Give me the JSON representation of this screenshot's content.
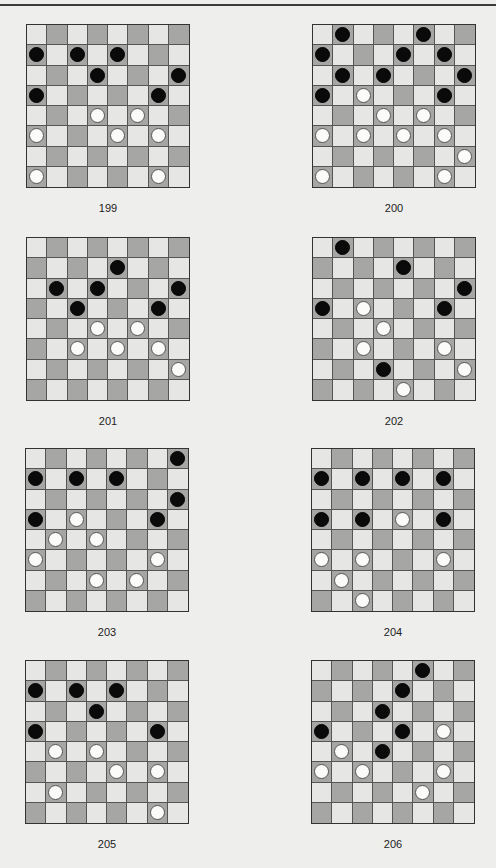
{
  "page": {
    "colors": {
      "light_square": "#e6e6e4",
      "dark_square": "#a6a6a4",
      "black_piece": "#0a0a0a",
      "white_piece": "#fbfbfa"
    }
  },
  "puzzles": [
    {
      "number": "199",
      "left": 26,
      "top": 24,
      "black": [
        [
          1,
          0
        ],
        [
          1,
          2
        ],
        [
          1,
          4
        ],
        [
          2,
          3
        ],
        [
          2,
          7
        ],
        [
          3,
          0
        ],
        [
          3,
          6
        ]
      ],
      "white": [
        [
          4,
          3
        ],
        [
          4,
          5
        ],
        [
          5,
          0
        ],
        [
          5,
          4
        ],
        [
          5,
          6
        ],
        [
          7,
          0
        ],
        [
          7,
          6
        ]
      ]
    },
    {
      "number": "200",
      "left": 312,
      "top": 24,
      "black": [
        [
          0,
          1
        ],
        [
          0,
          5
        ],
        [
          1,
          0
        ],
        [
          1,
          4
        ],
        [
          1,
          6
        ],
        [
          2,
          1
        ],
        [
          2,
          3
        ],
        [
          2,
          7
        ],
        [
          3,
          0
        ],
        [
          3,
          6
        ]
      ],
      "white": [
        [
          3,
          2
        ],
        [
          4,
          3
        ],
        [
          4,
          5
        ],
        [
          5,
          0
        ],
        [
          5,
          2
        ],
        [
          5,
          4
        ],
        [
          5,
          6
        ],
        [
          6,
          7
        ],
        [
          7,
          0
        ],
        [
          7,
          6
        ]
      ]
    },
    {
      "number": "201",
      "left": 26,
      "top": 237,
      "black": [
        [
          1,
          4
        ],
        [
          2,
          1
        ],
        [
          2,
          3
        ],
        [
          2,
          7
        ],
        [
          3,
          2
        ],
        [
          3,
          6
        ]
      ],
      "white": [
        [
          4,
          3
        ],
        [
          4,
          5
        ],
        [
          5,
          2
        ],
        [
          5,
          4
        ],
        [
          5,
          6
        ],
        [
          6,
          7
        ]
      ]
    },
    {
      "number": "202",
      "left": 312,
      "top": 237,
      "black": [
        [
          0,
          1
        ],
        [
          1,
          4
        ],
        [
          2,
          7
        ],
        [
          3,
          0
        ],
        [
          3,
          6
        ],
        [
          6,
          3
        ]
      ],
      "white": [
        [
          3,
          2
        ],
        [
          4,
          3
        ],
        [
          5,
          2
        ],
        [
          5,
          6
        ],
        [
          6,
          7
        ],
        [
          7,
          4
        ]
      ]
    },
    {
      "number": "203",
      "left": 25,
      "top": 448,
      "black": [
        [
          0,
          7
        ],
        [
          1,
          0
        ],
        [
          1,
          2
        ],
        [
          1,
          4
        ],
        [
          2,
          7
        ],
        [
          3,
          0
        ],
        [
          3,
          6
        ]
      ],
      "white": [
        [
          3,
          2
        ],
        [
          4,
          1
        ],
        [
          4,
          3
        ],
        [
          5,
          0
        ],
        [
          5,
          6
        ],
        [
          6,
          3
        ],
        [
          6,
          5
        ]
      ]
    },
    {
      "number": "204",
      "left": 311,
      "top": 448,
      "black": [
        [
          1,
          0
        ],
        [
          1,
          2
        ],
        [
          1,
          4
        ],
        [
          1,
          6
        ],
        [
          3,
          0
        ],
        [
          3,
          2
        ],
        [
          3,
          6
        ]
      ],
      "white": [
        [
          3,
          4
        ],
        [
          5,
          0
        ],
        [
          5,
          2
        ],
        [
          5,
          6
        ],
        [
          6,
          1
        ],
        [
          7,
          2
        ]
      ]
    },
    {
      "number": "205",
      "left": 25,
      "top": 660,
      "black": [
        [
          1,
          0
        ],
        [
          1,
          2
        ],
        [
          1,
          4
        ],
        [
          2,
          3
        ],
        [
          3,
          0
        ],
        [
          3,
          6
        ]
      ],
      "white": [
        [
          4,
          1
        ],
        [
          4,
          3
        ],
        [
          5,
          4
        ],
        [
          5,
          6
        ],
        [
          6,
          1
        ],
        [
          7,
          6
        ]
      ]
    },
    {
      "number": "206",
      "left": 311,
      "top": 660,
      "black": [
        [
          0,
          5
        ],
        [
          1,
          4
        ],
        [
          2,
          3
        ],
        [
          3,
          0
        ],
        [
          3,
          4
        ],
        [
          4,
          3
        ]
      ],
      "white": [
        [
          3,
          6
        ],
        [
          4,
          1
        ],
        [
          5,
          0
        ],
        [
          5,
          2
        ],
        [
          5,
          6
        ],
        [
          6,
          5
        ]
      ]
    }
  ]
}
